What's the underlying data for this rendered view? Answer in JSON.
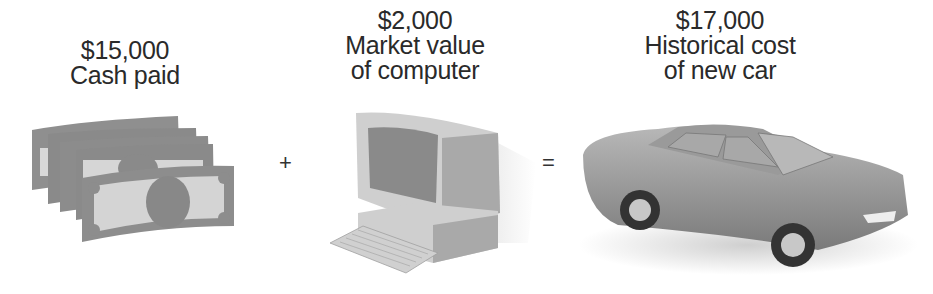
{
  "equation": {
    "items": [
      {
        "amount": "$15,000",
        "line1": "Cash paid",
        "line2": "",
        "icon": "cash-icon"
      },
      {
        "amount": "$2,000",
        "line1": "Market value",
        "line2": "of computer",
        "icon": "computer-icon"
      },
      {
        "amount": "$17,000",
        "line1": "Historical cost",
        "line2": "of new car",
        "icon": "car-icon"
      }
    ],
    "operators": {
      "plus": "+",
      "equals": "="
    }
  },
  "colors": {
    "text": "#2a2a2a",
    "illustration_gray": "#8a8a8a",
    "illustration_light": "#d0d0d0"
  }
}
